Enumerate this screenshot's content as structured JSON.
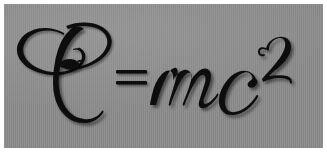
{
  "image": {
    "subject": "mass-energy-equivalence-equation",
    "equation_text": "E = mc²",
    "equation_plain": "E = mc2",
    "style": "ornate calligraphic script, bold italic, with drop shadow",
    "alt_text": "E = mc2"
  },
  "canvas": {
    "width_px": 327,
    "height_px": 159,
    "page_background": "#ffffff"
  },
  "panel": {
    "background_color": "#8b8b8b",
    "left_px": 4,
    "top_px": 4,
    "width_px": 319,
    "height_px": 144,
    "texture": "fine-vertical-scanlines"
  },
  "equation": {
    "ink_color": "#0b0b0b",
    "shadow_color": "rgba(0,0,0,0.45)",
    "terms": [
      {
        "id": "energy",
        "glyph": "E",
        "label": "script-capital-e",
        "role": "energy",
        "ornament": "oval-flourish-loop"
      },
      {
        "id": "equals",
        "glyph": "=",
        "label": "equals-sign",
        "role": "operator",
        "bars": 2
      },
      {
        "id": "mass",
        "glyph": "m",
        "label": "italic-script-m",
        "role": "mass"
      },
      {
        "id": "speed-of-light",
        "glyph": "c",
        "label": "italic-script-c",
        "role": "speed-of-light"
      },
      {
        "id": "exponent",
        "glyph": "2",
        "label": "superscript-two",
        "role": "exponent",
        "ornament": "curled-top"
      }
    ]
  }
}
